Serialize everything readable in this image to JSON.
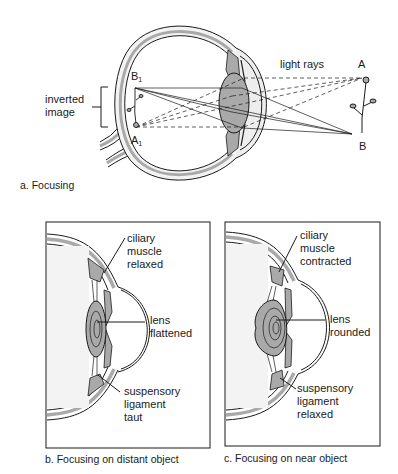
{
  "figure_a": {
    "caption": "a. Focusing",
    "labels": {
      "light_rays": "light rays",
      "point_a": "A",
      "point_b": "B",
      "image_b1_base": "B",
      "image_b1_sub": "1",
      "image_a1_base": "A",
      "image_a1_sub": "1",
      "inverted_image_line1": "inverted",
      "inverted_image_line2": "image"
    }
  },
  "figure_b": {
    "caption": "b. Focusing on distant object",
    "labels": {
      "ciliary_line1": "ciliary",
      "ciliary_line2": "muscle",
      "ciliary_line3": "relaxed",
      "lens_line1": "lens",
      "lens_line2": "flattened",
      "ligament_line1": "suspensory",
      "ligament_line2": "ligament",
      "ligament_line3": "taut"
    }
  },
  "figure_c": {
    "caption": "c. Focusing on near object",
    "labels": {
      "ciliary_line1": "ciliary",
      "ciliary_line2": "muscle",
      "ciliary_line3": "contracted",
      "lens_line1": "lens",
      "lens_line2": "rounded",
      "ligament_line1": "suspensory",
      "ligament_line2": "ligament",
      "ligament_line3": "relaxed"
    }
  },
  "colors": {
    "outline": "#1a1a1a",
    "tissue_gray": "#a9a9a9",
    "light_gray": "#e6e6e6",
    "background": "#ffffff"
  }
}
